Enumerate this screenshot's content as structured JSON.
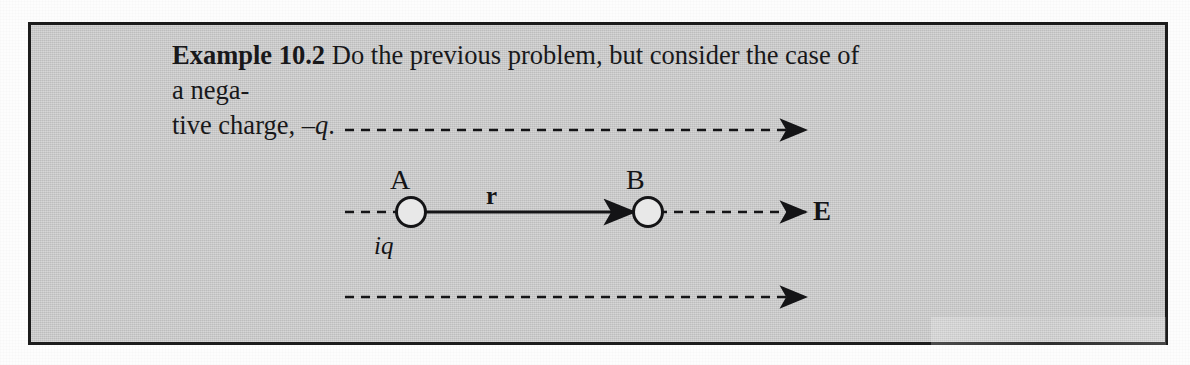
{
  "page": {
    "background_color": "#fdfdfd",
    "box_background_color": "#c9c9c9",
    "box_border_color": "#1c1c1c",
    "ink_color": "#18181a"
  },
  "example": {
    "number_label": "Example 10.2",
    "line1_text": "Do the previous problem, but consider the case of a nega-",
    "line2_prefix": "tive charge, ",
    "line2_math": "–q",
    "line2_suffix": "."
  },
  "diagram": {
    "point_a_label": "A",
    "point_b_label": "B",
    "vector_label": "r",
    "field_label": "E",
    "charge_label": "iq",
    "field_line_count": 3,
    "field_direction": "right"
  }
}
